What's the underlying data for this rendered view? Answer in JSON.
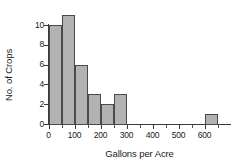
{
  "chart_data": {
    "type": "bar",
    "title": "",
    "subtitle": "",
    "xlabel": "Gallons per Acre",
    "ylabel": "No. of Crops",
    "xlim": [
      -10,
      690
    ],
    "ylim": [
      0,
      11
    ],
    "grid": false,
    "legend": null,
    "xticks": [
      0,
      100,
      200,
      300,
      400,
      500,
      600
    ],
    "xtick_labels": [
      "0",
      "100",
      "200",
      "300",
      "400",
      "500",
      "600"
    ],
    "xminor_ticks": [
      50,
      150,
      250,
      350,
      450,
      550,
      650
    ],
    "yticks": [
      0,
      2,
      4,
      6,
      8,
      10
    ],
    "ytick_labels": [
      "0",
      "2",
      "4",
      "6",
      "8",
      "10"
    ],
    "bin_width": 50,
    "bins": [
      {
        "label": "0-50",
        "x0": 0,
        "x1": 50,
        "value": 10
      },
      {
        "label": "50-100",
        "x0": 50,
        "x1": 100,
        "value": 11
      },
      {
        "label": "100-150",
        "x0": 100,
        "x1": 150,
        "value": 6
      },
      {
        "label": "150-200",
        "x0": 150,
        "x1": 200,
        "value": 3
      },
      {
        "label": "200-250",
        "x0": 200,
        "x1": 250,
        "value": 2
      },
      {
        "label": "250-300",
        "x0": 250,
        "x1": 300,
        "value": 3
      },
      {
        "label": "300-350",
        "x0": 300,
        "x1": 350,
        "value": 0
      },
      {
        "label": "350-400",
        "x0": 350,
        "x1": 400,
        "value": 0
      },
      {
        "label": "400-450",
        "x0": 400,
        "x1": 450,
        "value": 0
      },
      {
        "label": "450-500",
        "x0": 450,
        "x1": 500,
        "value": 0
      },
      {
        "label": "500-550",
        "x0": 500,
        "x1": 550,
        "value": 0
      },
      {
        "label": "550-600",
        "x0": 550,
        "x1": 600,
        "value": 0
      },
      {
        "label": "600-650",
        "x0": 600,
        "x1": 650,
        "value": 1
      }
    ],
    "categories": [
      "0-50",
      "50-100",
      "100-150",
      "150-200",
      "200-250",
      "250-300",
      "300-350",
      "350-400",
      "400-450",
      "450-500",
      "500-550",
      "550-600",
      "600-650"
    ],
    "values": [
      10,
      11,
      6,
      3,
      2,
      3,
      0,
      0,
      0,
      0,
      0,
      0,
      1
    ],
    "colors": {
      "bar_fill": "#b2b2b2",
      "bar_edge": "#4a4a4a",
      "axis": "#3a3a3a",
      "text": "#1a1a1a",
      "background": "#ffffff"
    }
  }
}
